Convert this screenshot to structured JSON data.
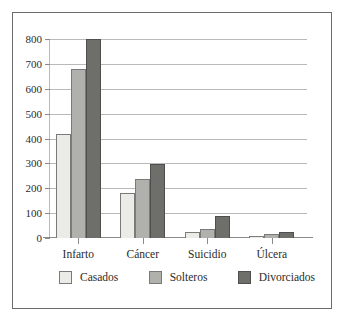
{
  "chart_data": {
    "type": "bar",
    "title": "",
    "subtitle": "",
    "xlabel": "",
    "ylabel": "",
    "categories": [
      "Infarto",
      "Cáncer",
      "Suicidio",
      "Úlcera"
    ],
    "series": [
      {
        "name": "Casados",
        "color": "#ebebe8",
        "values": [
          420,
          180,
          25,
          8
        ]
      },
      {
        "name": "Solteros",
        "color": "#b0b0ad",
        "values": [
          680,
          237,
          35,
          18
        ]
      },
      {
        "name": "Divorciados",
        "color": "#6e6e6b",
        "values": [
          800,
          298,
          88,
          23
        ]
      }
    ],
    "ylim": [
      0,
      800
    ],
    "ytick_values": [
      0,
      100,
      200,
      300,
      400,
      500,
      600,
      700,
      800
    ],
    "ytick_labels": [
      "0",
      "100",
      "200",
      "300",
      "400",
      "500",
      "600",
      "700",
      "800"
    ],
    "grid": true,
    "grid_axis": "y",
    "legend_position": "bottom",
    "frame": true
  },
  "colors": {
    "frame": "#6b6b6b",
    "gridline": "#b9b9b9",
    "axis": "#8a8a8a",
    "text": "#2b2b2b",
    "background": "#ffffff"
  }
}
